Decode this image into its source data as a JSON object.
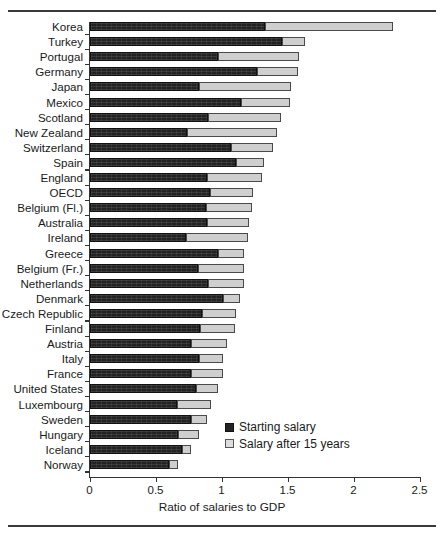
{
  "chart_data": {
    "type": "bar",
    "orientation": "horizontal",
    "stacked": true,
    "title": "",
    "xlabel": "Ratio of salaries to GDP",
    "ylabel": "",
    "xlim": [
      0,
      2.5
    ],
    "xticks": [
      0,
      0.5,
      1,
      1.5,
      2,
      2.5
    ],
    "xtick_labels": [
      "0",
      "0.5",
      "1",
      "1.5",
      "2",
      "2.5"
    ],
    "grid": false,
    "legend_position": "bottom-right",
    "categories": [
      "Korea",
      "Turkey",
      "Portugal",
      "Germany",
      "Japan",
      "Mexico",
      "Scotland",
      "New Zealand",
      "Switzerland",
      "Spain",
      "England",
      "OECD",
      "Belgium (Fl.)",
      "Australia",
      "Ireland",
      "Greece",
      "Belgium (Fr.)",
      "Netherlands",
      "Denmark",
      "Czech Republic",
      "Finland",
      "Austria",
      "Italy",
      "France",
      "United States",
      "Luxembourg",
      "Sweden",
      "Hungary",
      "Iceland",
      "Norway"
    ],
    "series": [
      {
        "name": "Starting salary",
        "color": "#232323",
        "values": [
          1.33,
          1.46,
          0.97,
          1.27,
          0.83,
          1.15,
          0.9,
          0.74,
          1.07,
          1.11,
          0.89,
          0.91,
          0.88,
          0.89,
          0.73,
          0.97,
          0.82,
          0.9,
          1.01,
          0.85,
          0.84,
          0.77,
          0.83,
          0.77,
          0.81,
          0.66,
          0.77,
          0.67,
          0.7,
          0.6
        ]
      },
      {
        "name": "Salary after 15 years",
        "color": "#cfcfcf",
        "values": [
          0.97,
          0.17,
          0.62,
          0.31,
          0.7,
          0.37,
          0.55,
          0.68,
          0.32,
          0.21,
          0.42,
          0.33,
          0.35,
          0.32,
          0.47,
          0.2,
          0.35,
          0.27,
          0.13,
          0.26,
          0.26,
          0.27,
          0.18,
          0.24,
          0.16,
          0.26,
          0.12,
          0.16,
          0.07,
          0.07
        ]
      }
    ],
    "totals": [
      2.3,
      1.63,
      1.59,
      1.58,
      1.53,
      1.52,
      1.45,
      1.42,
      1.39,
      1.32,
      1.31,
      1.24,
      1.23,
      1.21,
      1.2,
      1.17,
      1.17,
      1.17,
      1.14,
      1.11,
      1.1,
      1.04,
      1.01,
      1.01,
      0.97,
      0.92,
      0.89,
      0.83,
      0.77,
      0.67
    ]
  },
  "legend": {
    "items": [
      {
        "label": "Starting salary"
      },
      {
        "label": "Salary after 15 years"
      }
    ]
  },
  "axis": {
    "x_title": "Ratio of salaries to GDP"
  }
}
